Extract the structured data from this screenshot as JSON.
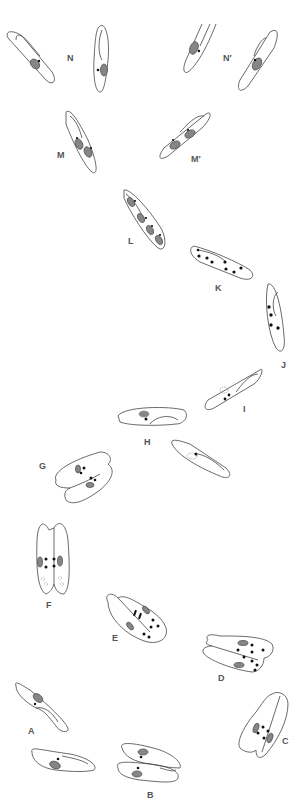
{
  "figure": {
    "type": "cell-cycle-diagram",
    "colors": {
      "outline": "#444444",
      "macronucleus": "#777777",
      "micronucleus": "#111111",
      "label": "#555555",
      "background": "#ffffff"
    },
    "labels": {
      "A": "A",
      "B": "B",
      "C": "C",
      "D": "D",
      "E": "E",
      "F": "F",
      "G": "G",
      "H": "H",
      "I": "I",
      "J": "J",
      "K": "K",
      "L": "L",
      "M": "M",
      "M_prime": "M′",
      "N": "N",
      "N_prime": "N′"
    },
    "stages": [
      {
        "id": "A",
        "cells": 2
      },
      {
        "id": "B",
        "cells": 1,
        "note": "paired cells"
      },
      {
        "id": "C",
        "cells": 1,
        "micronuclei": 4
      },
      {
        "id": "D",
        "cells": 1,
        "micronuclei": 8
      },
      {
        "id": "E",
        "cells": 1,
        "micronuclei": 8
      },
      {
        "id": "F",
        "cells": 1,
        "micronuclei": 4
      },
      {
        "id": "G",
        "cells": 1
      },
      {
        "id": "H",
        "cells": 2
      },
      {
        "id": "I",
        "cells": 1
      },
      {
        "id": "J",
        "cells": 1,
        "micronuclei": 4
      },
      {
        "id": "K",
        "cells": 1,
        "micronuclei": 8
      },
      {
        "id": "L",
        "cells": 1,
        "macronuclei": 4
      },
      {
        "id": "M",
        "cells": 1,
        "macronuclei": 2
      },
      {
        "id": "M_prime",
        "cells": 1,
        "macronuclei": 2
      },
      {
        "id": "N",
        "cells": 2
      },
      {
        "id": "N_prime",
        "cells": 2
      }
    ]
  }
}
